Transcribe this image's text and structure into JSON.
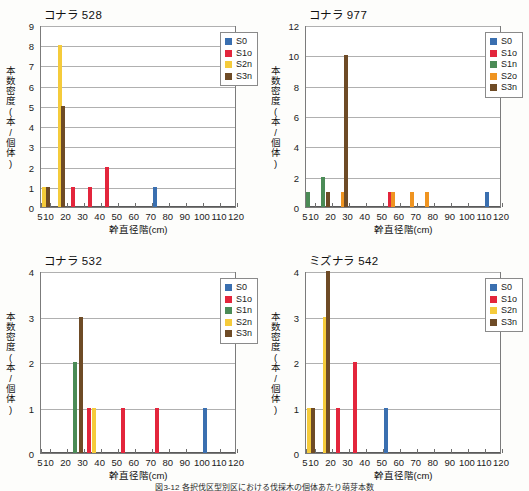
{
  "figure": {
    "caption": "図3-12 各択伐区型別区における伐採木の個体あたり萌芽本数"
  },
  "axis": {
    "ylabel": "本数密度(本/個体)",
    "xlabel": "幹直径階(cm)",
    "xticks": [
      5,
      10,
      20,
      30,
      40,
      50,
      60,
      70,
      80,
      90,
      100,
      110,
      120
    ],
    "xlim": [
      5,
      120
    ]
  },
  "series_colors": {
    "S0": "#3a6fb0",
    "S1o": "#e3253c",
    "S1n": "#4b8b56",
    "S2n": "#f5cb3b",
    "S2o": "#ef9421",
    "S3n": "#6e4b26"
  },
  "chart_data": [
    {
      "id": "konara-528",
      "type": "bar",
      "title": "コナラ 528",
      "xlabel": "幹直径階(cm)",
      "ylabel": "本数密度(本/個体)",
      "ylim": [
        0,
        9
      ],
      "yticks": [
        0,
        1,
        2,
        3,
        4,
        5,
        6,
        7,
        8,
        9
      ],
      "xlim": [
        5,
        120
      ],
      "grid": true,
      "legend_position": "top-right",
      "legend": [
        "S0",
        "S1o",
        "S2n",
        "S3n"
      ],
      "bars": [
        {
          "x": 7,
          "value": 1,
          "series": "S2n"
        },
        {
          "x": 9,
          "value": 1,
          "series": "S3n"
        },
        {
          "x": 16,
          "value": 8,
          "series": "S2n"
        },
        {
          "x": 18,
          "value": 5,
          "series": "S3n"
        },
        {
          "x": 24,
          "value": 1,
          "series": "S1o"
        },
        {
          "x": 34,
          "value": 1,
          "series": "S1o"
        },
        {
          "x": 44,
          "value": 2,
          "series": "S1o"
        },
        {
          "x": 72,
          "value": 1,
          "series": "S0"
        }
      ]
    },
    {
      "id": "konara-977",
      "type": "bar",
      "title": "コナラ 977",
      "xlabel": "幹直径階(cm)",
      "ylabel": "本数密度(本/個体)",
      "ylim": [
        0,
        12
      ],
      "yticks": [
        0,
        2,
        4,
        6,
        8,
        10,
        12
      ],
      "xlim": [
        5,
        120
      ],
      "grid": true,
      "legend_position": "top-right",
      "legend": [
        "S0",
        "S1o",
        "S1n",
        "S2o",
        "S3n"
      ],
      "bars": [
        {
          "x": 6,
          "value": 1,
          "series": "S1n"
        },
        {
          "x": 15,
          "value": 2,
          "series": "S1n"
        },
        {
          "x": 18,
          "value": 1,
          "series": "S3n"
        },
        {
          "x": 27,
          "value": 1,
          "series": "S2o"
        },
        {
          "x": 28.5,
          "value": 10,
          "series": "S3n"
        },
        {
          "x": 54,
          "value": 1,
          "series": "S1o"
        },
        {
          "x": 56,
          "value": 1,
          "series": "S2o"
        },
        {
          "x": 67,
          "value": 1,
          "series": "S2o"
        },
        {
          "x": 76,
          "value": 1,
          "series": "S2o"
        },
        {
          "x": 111,
          "value": 1,
          "series": "S0"
        }
      ]
    },
    {
      "id": "konara-532",
      "type": "bar",
      "title": "コナラ 532",
      "xlabel": "幹直径階(cm)",
      "ylabel": "本数密度(本/個体)",
      "ylim": [
        0,
        4
      ],
      "yticks": [
        0,
        1,
        2,
        3,
        4
      ],
      "xlim": [
        5,
        120
      ],
      "grid": true,
      "legend_position": "top-right",
      "legend": [
        "S0",
        "S1o",
        "S1n",
        "S2n",
        "S3n"
      ],
      "bars": [
        {
          "x": 25,
          "value": 2,
          "series": "S1n"
        },
        {
          "x": 28.5,
          "value": 3,
          "series": "S3n"
        },
        {
          "x": 33,
          "value": 1,
          "series": "S1o"
        },
        {
          "x": 36,
          "value": 1,
          "series": "S2n"
        },
        {
          "x": 53,
          "value": 1,
          "series": "S1o"
        },
        {
          "x": 73,
          "value": 1,
          "series": "S1o"
        },
        {
          "x": 101,
          "value": 1,
          "series": "S0"
        }
      ]
    },
    {
      "id": "mizunara-542",
      "type": "bar",
      "title": "ミズナラ 542",
      "xlabel": "幹直径階(cm)",
      "ylabel": "本数密度(本/個体)",
      "ylim": [
        0,
        4
      ],
      "yticks": [
        0,
        1,
        2,
        3,
        4
      ],
      "xlim": [
        5,
        120
      ],
      "grid": true,
      "legend_position": "top-right",
      "legend": [
        "S0",
        "S1o",
        "S2n",
        "S3n"
      ],
      "bars": [
        {
          "x": 7,
          "value": 1,
          "series": "S2n"
        },
        {
          "x": 9,
          "value": 1,
          "series": "S3n"
        },
        {
          "x": 16,
          "value": 3,
          "series": "S2n"
        },
        {
          "x": 18,
          "value": 4,
          "series": "S3n"
        },
        {
          "x": 24,
          "value": 1,
          "series": "S1o"
        },
        {
          "x": 34,
          "value": 2,
          "series": "S1o"
        },
        {
          "x": 52,
          "value": 1,
          "series": "S0"
        }
      ]
    }
  ]
}
